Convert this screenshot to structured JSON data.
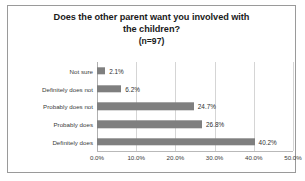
{
  "chart_data": {
    "type": "bar",
    "orientation": "horizontal",
    "title": "Does the other parent want you involved with the children?",
    "title_lines": [
      "Does the other parent want you involved with",
      "the children?"
    ],
    "subtitle": "(n=97)",
    "xlabel": "",
    "ylabel": "",
    "categories": [
      "Not sure",
      "Definitely does not",
      "Probably does not",
      "Probably does",
      "Definitely does"
    ],
    "values": [
      2.1,
      6.2,
      24.7,
      26.8,
      40.2
    ],
    "value_labels": [
      "2.1%",
      "6.2%",
      "24.7%",
      "26.8%",
      "40.2%"
    ],
    "xlim": [
      0,
      50
    ],
    "xticks": [
      0,
      10,
      20,
      30,
      40,
      50
    ],
    "xtick_labels": [
      "0.0%",
      "10.0%",
      "20.0%",
      "30.0%",
      "40.0%",
      "50.0%"
    ],
    "grid": true,
    "grid_axis": "x",
    "legend": false,
    "bar_color": "#7f7f7f",
    "grid_color": "#d5d5d5",
    "text_color": "#3a3a3a",
    "border_color": "#9a9a9a",
    "background_color": "#ffffff"
  }
}
